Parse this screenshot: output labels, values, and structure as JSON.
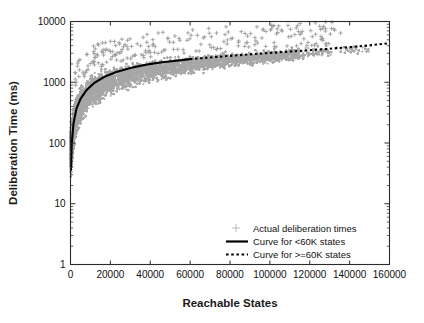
{
  "chart_data": {
    "type": "scatter",
    "title": "",
    "xlabel": "Reachable States",
    "ylabel": "Deliberation Time (ms)",
    "xlim": [
      0,
      160000
    ],
    "ylim": [
      1,
      10000
    ],
    "yscale": "log",
    "xscale": "linear",
    "grid": false,
    "legend_position": "lower-right-inside",
    "xticks": [
      0,
      20000,
      40000,
      60000,
      80000,
      100000,
      120000,
      140000,
      160000
    ],
    "xtick_labels": [
      "0",
      "20000",
      "40000",
      "60000",
      "80000",
      "100000",
      "120000",
      "140000",
      "160000"
    ],
    "yticks": [
      1,
      10,
      100,
      1000,
      10000
    ],
    "ytick_labels": [
      "1",
      "10",
      "100",
      "1000",
      "10000"
    ],
    "series": [
      {
        "name": "Actual deliberation times",
        "type": "scatter",
        "marker": "plus",
        "color": "#a8a8a8",
        "description": "Dense cloud of individual deliberation-time samples rising steeply from near 30 ms at 0 states to roughly 2000-3000 ms by 60000 states, then broadening and flattening toward 3000-5000 ms near 140000 states, with sparse outliers reaching about 7000 ms.",
        "band_points": [
          {
            "x": 500,
            "y_low": 25,
            "y_high": 260
          },
          {
            "x": 2000,
            "y_low": 70,
            "y_high": 620
          },
          {
            "x": 5000,
            "y_low": 150,
            "y_high": 1050
          },
          {
            "x": 10000,
            "y_low": 290,
            "y_high": 1500
          },
          {
            "x": 20000,
            "y_low": 520,
            "y_high": 2000
          },
          {
            "x": 30000,
            "y_low": 700,
            "y_high": 2350
          },
          {
            "x": 40000,
            "y_low": 880,
            "y_high": 2600
          },
          {
            "x": 50000,
            "y_low": 1050,
            "y_high": 2800
          },
          {
            "x": 60000,
            "y_low": 1250,
            "y_high": 3000
          },
          {
            "x": 80000,
            "y_low": 1600,
            "y_high": 3350
          },
          {
            "x": 100000,
            "y_low": 1950,
            "y_high": 3650
          },
          {
            "x": 120000,
            "y_low": 2300,
            "y_high": 3950
          },
          {
            "x": 140000,
            "y_low": 2700,
            "y_high": 4300
          }
        ]
      },
      {
        "name": "Curve for <60K states",
        "type": "line",
        "style": "solid",
        "color": "#000000",
        "x": [
          200,
          600,
          1500,
          3000,
          5000,
          8000,
          12000,
          17000,
          23000,
          30000,
          38000,
          46000,
          53000,
          60000
        ],
        "y": [
          36,
          95,
          210,
          370,
          530,
          740,
          980,
          1230,
          1480,
          1720,
          1950,
          2130,
          2260,
          2400
        ]
      },
      {
        "name": "Curve for >=60K states",
        "type": "line",
        "style": "dotted",
        "color": "#000000",
        "x": [
          60000,
          70000,
          80000,
          90000,
          100000,
          110000,
          120000,
          130000,
          140000,
          150000,
          160000
        ],
        "y": [
          2400,
          2560,
          2720,
          2880,
          3040,
          3200,
          3370,
          3560,
          3780,
          4050,
          4400
        ]
      }
    ],
    "legend": [
      {
        "label": "Actual deliberation times",
        "marker": "plus",
        "color": "#a8a8a8"
      },
      {
        "label": "Curve for <60K states",
        "marker": "solid-line",
        "color": "#000000"
      },
      {
        "label": "Curve for >=60K states",
        "marker": "dotted-line",
        "color": "#000000"
      }
    ]
  },
  "colors": {
    "scatter": "#a8a8a8",
    "curve": "#000000",
    "axis": "#2b2b2b",
    "background": "#ffffff"
  }
}
